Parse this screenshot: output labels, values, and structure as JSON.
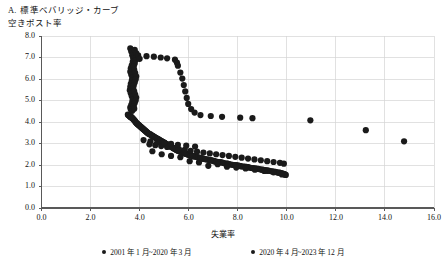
{
  "figure": {
    "panel_letter": "A.",
    "title": "標準ベバリッジ・カーブ",
    "y_axis_title": "空きポスト率",
    "x_axis_title": "失業率"
  },
  "legend": {
    "items": [
      {
        "label": "2001 年 1 月~2020 年 3 月",
        "color": "#1a1a1a",
        "marker": "filled-circle"
      },
      {
        "label": "2020 年 4 月~2023 年 12 月",
        "color": "#1a1a1a",
        "marker": "filled-circle"
      }
    ]
  },
  "colors": {
    "series_primary": "#1a1a1a",
    "series_secondary": "#1a1a1a",
    "grid": "#d4d4d4",
    "axis": "#595959",
    "text": "#111111",
    "background": "#ffffff"
  },
  "chart_data": {
    "type": "scatter",
    "title": "標準ベバリッジ・カーブ",
    "xlabel": "失業率",
    "ylabel": "空きポスト率",
    "xlim": [
      0.0,
      16.0
    ],
    "ylim": [
      0.0,
      8.0
    ],
    "xticks": [
      "0.0",
      "2.0",
      "4.0",
      "6.0",
      "8.0",
      "10.0",
      "12.0",
      "14.0",
      "16.0"
    ],
    "yticks": [
      "0.0",
      "1.0",
      "2.0",
      "3.0",
      "4.0",
      "5.0",
      "6.0",
      "7.0",
      "8.0"
    ],
    "xtick_values": [
      0,
      2,
      4,
      6,
      8,
      10,
      12,
      14,
      16
    ],
    "ytick_values": [
      0,
      1,
      2,
      3,
      4,
      5,
      6,
      7,
      8
    ],
    "grid": true,
    "grid_axis": "both",
    "legend_position": "below",
    "marker_size": 3.1,
    "series": [
      {
        "name": "2001 年 1 月~2020 年 3 月",
        "color": "#1a1a1a",
        "points": [
          [
            3.52,
            4.34
          ],
          [
            3.56,
            4.3
          ],
          [
            3.6,
            4.26
          ],
          [
            3.64,
            4.22
          ],
          [
            3.7,
            4.18
          ],
          [
            3.74,
            4.14
          ],
          [
            3.78,
            4.08
          ],
          [
            3.82,
            4.02
          ],
          [
            3.86,
            3.96
          ],
          [
            3.9,
            3.92
          ],
          [
            3.94,
            3.88
          ],
          [
            3.98,
            3.84
          ],
          [
            4.02,
            3.8
          ],
          [
            4.06,
            3.76
          ],
          [
            4.1,
            3.72
          ],
          [
            4.14,
            3.68
          ],
          [
            4.18,
            3.64
          ],
          [
            4.22,
            3.6
          ],
          [
            4.26,
            3.56
          ],
          [
            4.3,
            3.52
          ],
          [
            4.34,
            3.48
          ],
          [
            4.4,
            3.44
          ],
          [
            4.46,
            3.4
          ],
          [
            4.52,
            3.36
          ],
          [
            4.58,
            3.32
          ],
          [
            4.64,
            3.28
          ],
          [
            4.7,
            3.24
          ],
          [
            4.76,
            3.2
          ],
          [
            4.82,
            3.16
          ],
          [
            4.88,
            3.12
          ],
          [
            4.94,
            3.08
          ],
          [
            5.0,
            3.04
          ],
          [
            5.06,
            3.0
          ],
          [
            5.12,
            2.96
          ],
          [
            5.18,
            2.92
          ],
          [
            5.24,
            2.88
          ],
          [
            5.3,
            2.84
          ],
          [
            5.36,
            2.8
          ],
          [
            5.42,
            2.76
          ],
          [
            5.48,
            2.72
          ],
          [
            5.54,
            2.68
          ],
          [
            5.62,
            2.64
          ],
          [
            5.7,
            2.6
          ],
          [
            5.78,
            2.56
          ],
          [
            5.86,
            2.54
          ],
          [
            5.94,
            2.5
          ],
          [
            6.02,
            2.46
          ],
          [
            6.12,
            2.44
          ],
          [
            6.22,
            2.4
          ],
          [
            6.32,
            2.38
          ],
          [
            6.42,
            2.34
          ],
          [
            6.52,
            2.32
          ],
          [
            6.62,
            2.28
          ],
          [
            6.74,
            2.26
          ],
          [
            6.86,
            2.22
          ],
          [
            6.98,
            2.2
          ],
          [
            7.1,
            2.16
          ],
          [
            7.22,
            2.14
          ],
          [
            7.34,
            2.12
          ],
          [
            7.46,
            2.08
          ],
          [
            7.58,
            2.06
          ],
          [
            7.72,
            2.02
          ],
          [
            7.86,
            2.0
          ],
          [
            8.0,
            1.98
          ],
          [
            8.14,
            1.94
          ],
          [
            8.28,
            1.92
          ],
          [
            8.42,
            1.9
          ],
          [
            8.56,
            1.86
          ],
          [
            8.7,
            1.84
          ],
          [
            8.84,
            1.82
          ],
          [
            8.98,
            1.78
          ],
          [
            9.12,
            1.76
          ],
          [
            9.26,
            1.74
          ],
          [
            9.4,
            1.7
          ],
          [
            9.54,
            1.68
          ],
          [
            9.66,
            1.64
          ],
          [
            9.78,
            1.62
          ],
          [
            9.88,
            1.58
          ],
          [
            9.96,
            1.54
          ],
          [
            3.58,
            4.3
          ],
          [
            3.66,
            4.24
          ],
          [
            3.72,
            4.16
          ],
          [
            3.8,
            4.06
          ],
          [
            3.88,
            3.94
          ],
          [
            3.96,
            3.86
          ],
          [
            4.04,
            3.78
          ],
          [
            4.12,
            3.7
          ],
          [
            4.2,
            3.62
          ],
          [
            4.28,
            3.54
          ],
          [
            4.36,
            3.46
          ],
          [
            4.44,
            3.42
          ],
          [
            4.54,
            3.34
          ],
          [
            4.66,
            3.26
          ],
          [
            4.78,
            3.18
          ],
          [
            4.9,
            3.1
          ],
          [
            5.02,
            3.02
          ],
          [
            5.14,
            2.94
          ],
          [
            5.26,
            2.86
          ],
          [
            5.38,
            2.78
          ],
          [
            5.5,
            2.7
          ],
          [
            5.66,
            2.62
          ],
          [
            5.82,
            2.55
          ],
          [
            5.98,
            2.48
          ],
          [
            6.17,
            2.42
          ],
          [
            6.37,
            2.36
          ],
          [
            6.57,
            2.3
          ],
          [
            6.8,
            2.24
          ],
          [
            7.04,
            2.18
          ],
          [
            7.28,
            2.13
          ],
          [
            7.52,
            2.07
          ],
          [
            7.79,
            2.01
          ],
          [
            8.07,
            1.96
          ],
          [
            8.35,
            1.91
          ],
          [
            8.63,
            1.85
          ],
          [
            8.91,
            1.8
          ],
          [
            9.19,
            1.75
          ],
          [
            9.47,
            1.69
          ],
          [
            9.72,
            1.63
          ],
          [
            9.92,
            1.56
          ],
          [
            3.54,
            4.32
          ],
          [
            3.62,
            4.25
          ],
          [
            3.76,
            4.11
          ],
          [
            3.84,
            3.99
          ],
          [
            3.92,
            3.9
          ],
          [
            4.0,
            3.82
          ],
          [
            4.08,
            3.74
          ],
          [
            4.16,
            3.66
          ],
          [
            4.24,
            3.58
          ],
          [
            4.32,
            3.5
          ],
          [
            4.48,
            3.38
          ],
          [
            4.6,
            3.3
          ],
          [
            4.72,
            3.22
          ],
          [
            4.84,
            3.14
          ],
          [
            4.96,
            3.06
          ],
          [
            5.08,
            2.98
          ],
          [
            5.2,
            2.9
          ],
          [
            5.32,
            2.82
          ],
          [
            5.44,
            2.74
          ],
          [
            5.58,
            2.66
          ],
          [
            5.74,
            2.58
          ],
          [
            5.9,
            2.52
          ],
          [
            6.07,
            2.45
          ],
          [
            6.27,
            2.39
          ],
          [
            6.47,
            2.33
          ],
          [
            6.68,
            2.27
          ],
          [
            6.92,
            2.21
          ],
          [
            7.16,
            2.15
          ],
          [
            7.4,
            2.1
          ],
          [
            7.65,
            2.04
          ],
          [
            7.93,
            1.99
          ],
          [
            8.21,
            1.93
          ],
          [
            8.49,
            1.88
          ],
          [
            8.77,
            1.83
          ],
          [
            9.05,
            1.77
          ],
          [
            9.33,
            1.72
          ],
          [
            9.6,
            1.66
          ],
          [
            9.84,
            1.6
          ],
          [
            3.68,
            4.2
          ],
          [
            4.38,
            3.45
          ],
          [
            5.56,
            2.67
          ],
          [
            6.17,
            2.41
          ],
          [
            7.05,
            2.17
          ],
          [
            8.1,
            1.95
          ],
          [
            9.0,
            1.79
          ],
          [
            9.7,
            1.65
          ],
          [
            4.5,
            3.37
          ],
          [
            5.05,
            2.99
          ],
          [
            5.85,
            2.53
          ],
          [
            6.9,
            2.23
          ],
          [
            7.6,
            2.05
          ],
          [
            8.4,
            1.89
          ],
          [
            9.2,
            1.73
          ],
          [
            9.9,
            1.57
          ]
        ]
      },
      {
        "name": "2020 年 4 月~2023 年 12 月",
        "color": "#1a1a1a",
        "points": [
          [
            3.62,
            7.42
          ],
          [
            3.66,
            7.28
          ],
          [
            3.7,
            7.1
          ],
          [
            3.74,
            6.96
          ],
          [
            3.72,
            6.8
          ],
          [
            3.68,
            6.64
          ],
          [
            3.64,
            6.5
          ],
          [
            3.62,
            6.34
          ],
          [
            3.66,
            6.2
          ],
          [
            3.7,
            6.06
          ],
          [
            3.68,
            5.92
          ],
          [
            3.64,
            5.78
          ],
          [
            3.62,
            5.64
          ],
          [
            3.6,
            5.48
          ],
          [
            3.64,
            5.34
          ],
          [
            3.68,
            5.2
          ],
          [
            3.72,
            5.06
          ],
          [
            3.7,
            4.94
          ],
          [
            3.66,
            4.8
          ],
          [
            3.62,
            4.68
          ],
          [
            3.64,
            4.58
          ],
          [
            3.7,
            4.52
          ],
          [
            3.8,
            7.36
          ],
          [
            3.86,
            7.2
          ],
          [
            3.88,
            7.02
          ],
          [
            3.84,
            6.88
          ],
          [
            3.8,
            6.72
          ],
          [
            3.76,
            6.58
          ],
          [
            3.78,
            6.42
          ],
          [
            3.82,
            6.28
          ],
          [
            3.86,
            6.12
          ],
          [
            3.84,
            5.98
          ],
          [
            3.8,
            5.84
          ],
          [
            3.76,
            5.7
          ],
          [
            3.74,
            5.56
          ],
          [
            3.78,
            5.42
          ],
          [
            3.82,
            5.28
          ],
          [
            3.86,
            5.14
          ],
          [
            3.84,
            5.0
          ],
          [
            3.8,
            4.88
          ],
          [
            3.76,
            4.74
          ],
          [
            3.78,
            4.62
          ],
          [
            3.94,
            7.1
          ],
          [
            4.0,
            6.94
          ],
          [
            4.28,
            7.06
          ],
          [
            4.58,
            7.04
          ],
          [
            4.86,
            7.0
          ],
          [
            5.12,
            6.96
          ],
          [
            5.44,
            6.9
          ],
          [
            5.52,
            6.76
          ],
          [
            5.56,
            6.62
          ],
          [
            5.66,
            6.3
          ],
          [
            5.74,
            6.02
          ],
          [
            5.8,
            5.72
          ],
          [
            5.86,
            5.42
          ],
          [
            5.92,
            5.12
          ],
          [
            5.98,
            4.84
          ],
          [
            6.1,
            4.6
          ],
          [
            6.24,
            4.44
          ],
          [
            6.48,
            4.32
          ],
          [
            6.9,
            4.28
          ],
          [
            7.36,
            4.24
          ],
          [
            8.1,
            4.2
          ],
          [
            8.6,
            4.18
          ],
          [
            10.96,
            4.08
          ],
          [
            13.22,
            3.62
          ],
          [
            14.78,
            3.1
          ],
          [
            4.4,
            2.96
          ],
          [
            4.64,
            2.92
          ],
          [
            4.88,
            2.88
          ],
          [
            5.12,
            2.84
          ],
          [
            5.36,
            2.8
          ],
          [
            5.6,
            2.74
          ],
          [
            5.84,
            2.7
          ],
          [
            6.08,
            2.66
          ],
          [
            6.34,
            2.62
          ],
          [
            6.6,
            2.58
          ],
          [
            6.86,
            2.54
          ],
          [
            7.12,
            2.5
          ],
          [
            7.38,
            2.46
          ],
          [
            7.64,
            2.42
          ],
          [
            7.9,
            2.38
          ],
          [
            8.16,
            2.34
          ],
          [
            8.42,
            2.3
          ],
          [
            8.68,
            2.26
          ],
          [
            8.94,
            2.22
          ],
          [
            9.2,
            2.18
          ],
          [
            9.46,
            2.14
          ],
          [
            9.72,
            2.1
          ],
          [
            9.88,
            2.06
          ],
          [
            4.52,
            2.64
          ],
          [
            4.9,
            2.5
          ],
          [
            5.28,
            2.42
          ],
          [
            5.66,
            2.36
          ],
          [
            6.04,
            2.18
          ],
          [
            6.42,
            2.12
          ],
          [
            6.8,
            1.96
          ],
          [
            7.18,
            2.04
          ],
          [
            7.56,
            1.92
          ],
          [
            7.94,
            1.88
          ],
          [
            8.32,
            1.84
          ],
          [
            8.7,
            1.78
          ],
          [
            9.08,
            1.72
          ],
          [
            9.46,
            1.66
          ],
          [
            9.8,
            1.56
          ],
          [
            4.16,
            3.16
          ],
          [
            4.44,
            3.1
          ],
          [
            4.72,
            3.06
          ],
          [
            5.0,
            3.02
          ],
          [
            5.28,
            2.98
          ],
          [
            5.56,
            2.94
          ],
          [
            5.9,
            2.9
          ],
          [
            6.26,
            2.86
          ]
        ]
      }
    ]
  }
}
